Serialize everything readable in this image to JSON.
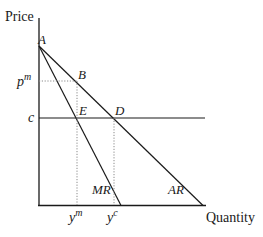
{
  "axes": {
    "y_label": "Price",
    "x_label": "Quantity"
  },
  "points": {
    "A": "A",
    "B": "B",
    "D": "D",
    "E": "E"
  },
  "y_ticks": {
    "pm_base": "p",
    "pm_sup": "m",
    "c": "c"
  },
  "x_ticks": {
    "ym_base": "y",
    "ym_sup": "m",
    "yc_base": "y",
    "yc_sup": "c"
  },
  "curves": {
    "mr": "MR",
    "ar": "AR"
  },
  "colors": {
    "line": "#1a1a1a",
    "dotted": "#8a8a8a"
  }
}
